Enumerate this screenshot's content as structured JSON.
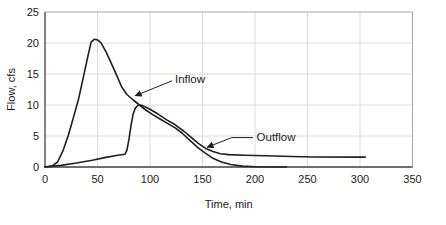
{
  "chart_data": {
    "type": "line",
    "title": "",
    "xlabel": "Time, min",
    "ylabel": "Flow, cfs",
    "xlim": [
      0,
      350
    ],
    "ylim": [
      0,
      25
    ],
    "x_ticks": [
      0,
      50,
      100,
      150,
      200,
      250,
      300,
      350
    ],
    "y_ticks": [
      0,
      5,
      10,
      15,
      20,
      25
    ],
    "grid": true,
    "legend_position": "none",
    "colors": {
      "line": "#1f1f1f",
      "gridline": "#dcdcdc",
      "plot_border": "#a6a6a6",
      "x_axis": "#6e6e6e",
      "y_axis": "#4d4d4d",
      "text": "#1a1a1a",
      "background": "#ffffff"
    },
    "series": [
      {
        "name": "Inflow",
        "points": [
          [
            0,
            0
          ],
          [
            7,
            0.2
          ],
          [
            12,
            0.8
          ],
          [
            17,
            2.6
          ],
          [
            22,
            5.0
          ],
          [
            27,
            7.9
          ],
          [
            32,
            11.0
          ],
          [
            37,
            14.8
          ],
          [
            41,
            18.0
          ],
          [
            44,
            20.2
          ],
          [
            47,
            20.6
          ],
          [
            50,
            20.5
          ],
          [
            53,
            20.1
          ],
          [
            58,
            18.6
          ],
          [
            63,
            16.8
          ],
          [
            68,
            14.9
          ],
          [
            73,
            12.9
          ],
          [
            78,
            11.7
          ],
          [
            84,
            10.8
          ],
          [
            90,
            10.0
          ],
          [
            96,
            9.2
          ],
          [
            103,
            8.4
          ],
          [
            110,
            7.7
          ],
          [
            117,
            7.0
          ],
          [
            124,
            6.3
          ],
          [
            131,
            5.4
          ],
          [
            138,
            4.3
          ],
          [
            145,
            3.2
          ],
          [
            152,
            2.3
          ],
          [
            160,
            1.4
          ],
          [
            168,
            0.8
          ],
          [
            177,
            0.4
          ],
          [
            188,
            0.15
          ],
          [
            200,
            0.05
          ],
          [
            230,
            0
          ]
        ]
      },
      {
        "name": "Outflow",
        "points": [
          [
            0,
            0
          ],
          [
            15,
            0.25
          ],
          [
            30,
            0.65
          ],
          [
            45,
            1.1
          ],
          [
            58,
            1.55
          ],
          [
            68,
            1.85
          ],
          [
            76,
            2.05
          ],
          [
            78,
            2.7
          ],
          [
            80,
            4.5
          ],
          [
            82,
            6.8
          ],
          [
            84,
            8.6
          ],
          [
            86,
            9.5
          ],
          [
            89,
            10.0
          ],
          [
            93,
            9.9
          ],
          [
            100,
            9.3
          ],
          [
            108,
            8.5
          ],
          [
            116,
            7.6
          ],
          [
            124,
            6.8
          ],
          [
            132,
            5.8
          ],
          [
            139,
            4.8
          ],
          [
            146,
            3.8
          ],
          [
            153,
            3.0
          ],
          [
            160,
            2.5
          ],
          [
            167,
            2.15
          ],
          [
            175,
            2.0
          ],
          [
            190,
            1.9
          ],
          [
            210,
            1.8
          ],
          [
            235,
            1.7
          ],
          [
            255,
            1.62
          ],
          [
            305,
            1.6
          ]
        ]
      }
    ],
    "annotations": [
      {
        "label": "Inflow",
        "text_t": 123.8,
        "text_q": 13.5,
        "leader": [
          [
            121,
            13.9
          ],
          [
            86,
            11.5
          ]
        ]
      },
      {
        "label": "Outflow",
        "text_t": 201.5,
        "text_q": 4.2,
        "leader": [
          [
            198,
            4.75
          ],
          [
            178,
            4.75
          ],
          [
            154.5,
            3.2
          ]
        ]
      }
    ]
  }
}
